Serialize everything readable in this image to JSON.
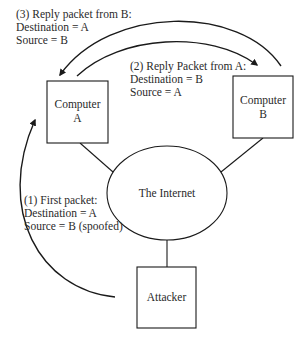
{
  "diagram": {
    "nodes": {
      "computer_a": {
        "line1": "Computer",
        "line2": "A"
      },
      "computer_b": {
        "line1": "Computer",
        "line2": "B"
      },
      "internet": {
        "label": "The Internet"
      },
      "attacker": {
        "label": "Attacker"
      }
    },
    "packets": {
      "first": {
        "title": "(1) First packet:",
        "destination": "Destination = A",
        "source": "Source = B (spoofed)"
      },
      "reply_a": {
        "title": "(2) Reply Packet from A:",
        "destination": "Destination = B",
        "source": "Source = A"
      },
      "reply_b": {
        "title": "(3) Reply packet from B:",
        "destination": "Destination = A",
        "source": "Source = B"
      }
    },
    "colors": {
      "stroke": "#1a1a1a",
      "text": "#2a2a2a",
      "background": "#ffffff"
    }
  }
}
